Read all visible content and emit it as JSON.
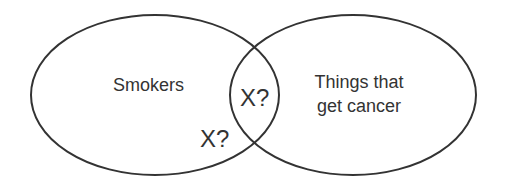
{
  "diagram": {
    "type": "venn",
    "stroke_color": "#333333",
    "text_color": "#333333",
    "background": "#ffffff",
    "sets": [
      {
        "id": "smokers",
        "label": "Smokers",
        "shape": {
          "cx": 155,
          "cy": 95,
          "rx": 124,
          "ry": 80
        }
      },
      {
        "id": "things-that-get-cancer",
        "label_lines": [
          "Things that",
          "get cancer"
        ],
        "shape": {
          "cx": 353,
          "cy": 95,
          "rx": 123,
          "ry": 80
        }
      }
    ],
    "annotations": {
      "intersection": "X?",
      "smokers_only": "X?"
    }
  }
}
